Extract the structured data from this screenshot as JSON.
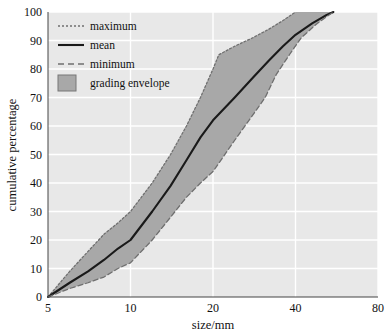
{
  "chart_data": {
    "type": "area",
    "title": "",
    "subtitle": "",
    "xlabel": "size/mm",
    "ylabel": "cumulative percentage",
    "xscale": "log",
    "yscale": "linear",
    "xlim": [
      5,
      80
    ],
    "ylim": [
      0,
      100
    ],
    "xticks": [
      5,
      10,
      20,
      40,
      80
    ],
    "xtick_labels": [
      "5",
      "10",
      "20",
      "40",
      "80"
    ],
    "yticks": [
      0,
      10,
      20,
      30,
      40,
      50,
      60,
      70,
      80,
      90,
      100
    ],
    "ytick_labels": [
      "0",
      "10",
      "20",
      "30",
      "40",
      "50",
      "60",
      "70",
      "80",
      "90",
      "100"
    ],
    "grid": true,
    "grid_color": "#ffffff",
    "plot_background": "#e8e8e8",
    "legend_position": "top-left",
    "series": [
      {
        "name": "maximum",
        "style": "dotted",
        "color": "#6f6f6f",
        "x": [
          5,
          6,
          7,
          8,
          9,
          10,
          12,
          14,
          16,
          18,
          20,
          21,
          24,
          28,
          32,
          36,
          40
        ],
        "values": [
          0,
          9,
          16,
          22,
          26,
          30,
          40,
          50,
          60,
          70,
          80,
          85,
          88,
          91,
          94,
          97,
          100
        ]
      },
      {
        "name": "mean",
        "style": "solid",
        "color": "#1a1a1a",
        "x": [
          5,
          6,
          7,
          8,
          9,
          10,
          12,
          14,
          16,
          18,
          20,
          24,
          28,
          32,
          36,
          40,
          46,
          52,
          55
        ],
        "values": [
          0,
          5,
          9,
          13,
          17,
          20,
          30,
          39,
          48,
          56,
          62,
          70,
          77,
          83,
          88,
          92,
          96,
          99,
          100
        ]
      },
      {
        "name": "minimum",
        "style": "dashed",
        "color": "#6f6f6f",
        "x": [
          5,
          6,
          7,
          8,
          9,
          10,
          12,
          14,
          16,
          18,
          20,
          24,
          28,
          31,
          34,
          38,
          42,
          48,
          55
        ],
        "values": [
          0,
          3,
          5,
          7,
          10,
          12,
          20,
          28,
          35,
          40,
          44,
          55,
          64,
          70,
          78,
          85,
          91,
          96,
          100
        ]
      }
    ],
    "bands": [
      {
        "name": "grading envelope",
        "fill": "#a8a8a8",
        "upper_series": "maximum",
        "lower_series": "minimum"
      }
    ]
  },
  "legend": {
    "items": [
      {
        "label": "maximum",
        "marker": "dotted-line"
      },
      {
        "label": "mean",
        "marker": "solid-line"
      },
      {
        "label": "minimum",
        "marker": "dashed-line"
      },
      {
        "label": "grading envelope",
        "marker": "filled-swatch"
      }
    ]
  },
  "axes": {
    "x_title": "size/mm",
    "y_title": "cumulative percentage"
  }
}
